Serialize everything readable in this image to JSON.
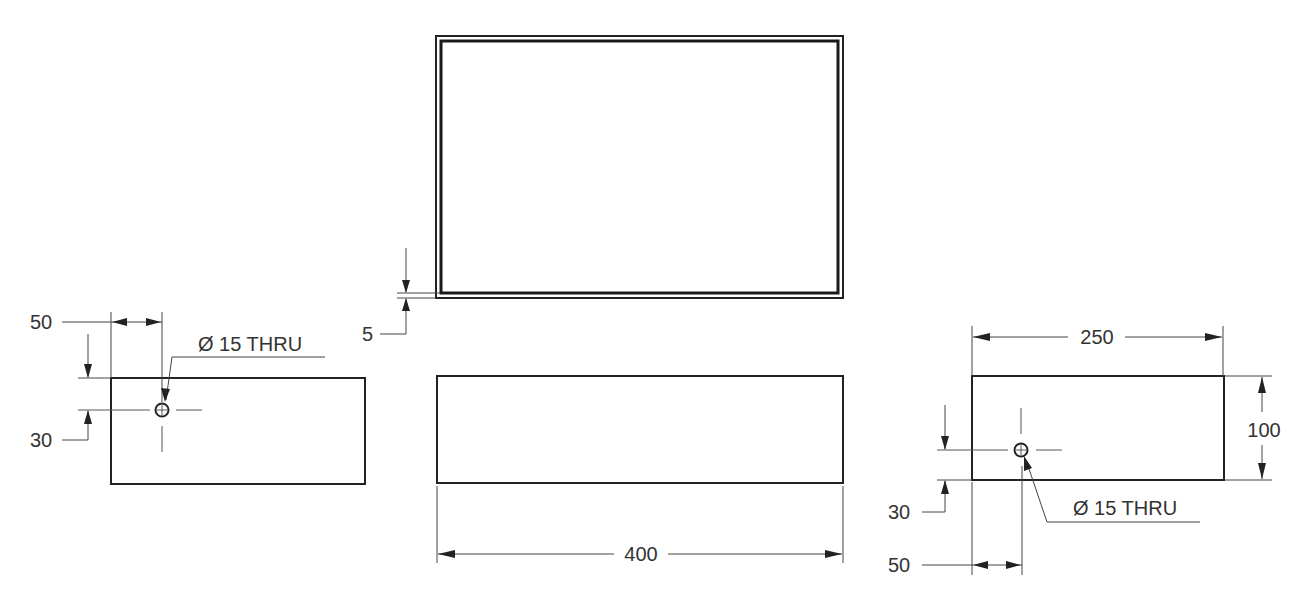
{
  "drawing": {
    "type": "orthographic multiview engineering drawing",
    "colors": {
      "line": "#222222",
      "text": "#333333",
      "background": "#ffffff"
    },
    "views": {
      "top": {
        "name": "top view (hollow box, wall thickness)",
        "dimensions": {
          "wall_thickness": "5"
        }
      },
      "front": {
        "name": "front view",
        "dimensions": {
          "width": "400"
        }
      },
      "left": {
        "name": "left side view",
        "dimensions": {
          "hole_x": "50",
          "hole_y": "30"
        },
        "hole_note": "Ø 15 THRU"
      },
      "right": {
        "name": "right side view",
        "dimensions": {
          "width": "250",
          "height": "100",
          "hole_x": "50",
          "hole_y": "30"
        },
        "hole_note": "Ø 15 THRU"
      }
    }
  }
}
